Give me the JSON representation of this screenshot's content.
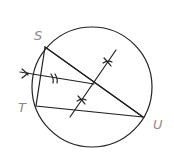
{
  "diagram": {
    "type": "geometry-construction",
    "points": {
      "S": {
        "label": "S",
        "x": 45,
        "y": 47
      },
      "T": {
        "label": "T",
        "x": 36,
        "y": 106
      },
      "U": {
        "label": "U",
        "x": 143,
        "y": 117
      }
    },
    "labels": [
      {
        "text": "S",
        "x": 34,
        "y": 40
      },
      {
        "text": "T",
        "x": 18,
        "y": 112
      },
      {
        "text": "U",
        "x": 153,
        "y": 129
      }
    ],
    "circle": {
      "cx": 92,
      "cy": 87,
      "r": 60
    },
    "colors": {
      "line": "#222222",
      "label": "#8a8a8a",
      "background": "#ffffff"
    }
  }
}
